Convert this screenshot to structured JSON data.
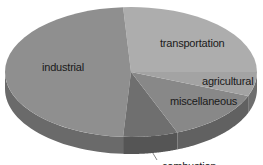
{
  "chart_data": {
    "type": "pie",
    "style": "3d-tilted",
    "title": "",
    "legend": "none (labels on slices)",
    "slices": [
      {
        "label": "transportation",
        "value": 26,
        "top_color": "#adadad",
        "side_color": "#7a7a7a",
        "label_pos": [
          194,
          43
        ]
      },
      {
        "label": "industrial",
        "value": 48,
        "top_color": "#8f8f8f",
        "side_color": "#6a6a6a",
        "label_pos": [
          62,
          71
        ]
      },
      {
        "label": "combustion",
        "value": 7,
        "top_color": "#6f6f6f",
        "side_color": "#555555",
        "label_pos": [
          182,
          168
        ]
      },
      {
        "label": "miscellaneous",
        "value": 13,
        "top_color": "#888888",
        "side_color": "#616161",
        "label_pos": [
          199,
          104
        ]
      },
      {
        "label": "agricultural",
        "value": 6,
        "top_color": "#a3a3a3",
        "side_color": "#6e6e6e",
        "label_pos": [
          225,
          85
        ]
      }
    ],
    "start_angle_deg": 0,
    "direction": "counterclockwise-from-right",
    "order_from_start": [
      "transportation",
      "industrial",
      "combustion",
      "miscellaneous",
      "agricultural"
    ]
  },
  "labels": {
    "transportation": "transportation",
    "industrial": "industrial",
    "agricultural": "agricultural",
    "miscellaneous": "miscellaneous",
    "combustion": "combustion"
  }
}
